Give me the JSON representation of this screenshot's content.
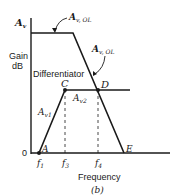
{
  "diagram": {
    "y_axis_symbol": "A",
    "y_axis_symbol_sub": "v",
    "y_axis_label_line1": "Gain",
    "y_axis_label_line2": "dB",
    "origin_label": "0",
    "x_axis_label": "Frequency",
    "caption": "(b)",
    "open_loop_label_top": "A",
    "open_loop_label_top_sub": "v, OL",
    "open_loop_label_right": "A",
    "open_loop_label_right_sub": "v, OL",
    "differentiator_label": "Differentiator",
    "point_labels": {
      "A": "A",
      "C": "C",
      "D": "D",
      "E": "E"
    },
    "gain_labels": {
      "av1": "A",
      "av1_sub": "v1",
      "av2": "A",
      "av2_sub": "v2"
    },
    "freq_ticks": {
      "f1": "f",
      "f1_sub": "1",
      "f3": "f",
      "f3_sub": "3",
      "f4": "f",
      "f4_sub": "4"
    },
    "colors": {
      "line": "#1a1a1a",
      "background": "#ffffff"
    }
  }
}
